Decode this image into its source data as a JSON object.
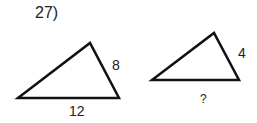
{
  "problem_number": "27)",
  "triangles": [
    {
      "name": "large-triangle",
      "vertices": [
        [
          18,
          98
        ],
        [
          90,
          43
        ],
        [
          119,
          98
        ]
      ],
      "side_labels": {
        "right": "8",
        "bottom": "12"
      }
    },
    {
      "name": "small-triangle",
      "vertices": [
        [
          152,
          80
        ],
        [
          214,
          33
        ],
        [
          239,
          80
        ]
      ],
      "side_labels": {
        "right": "4",
        "bottom": "?"
      }
    }
  ],
  "colors": {
    "stroke": "#111111",
    "text": "#222222",
    "background": "#ffffff"
  }
}
